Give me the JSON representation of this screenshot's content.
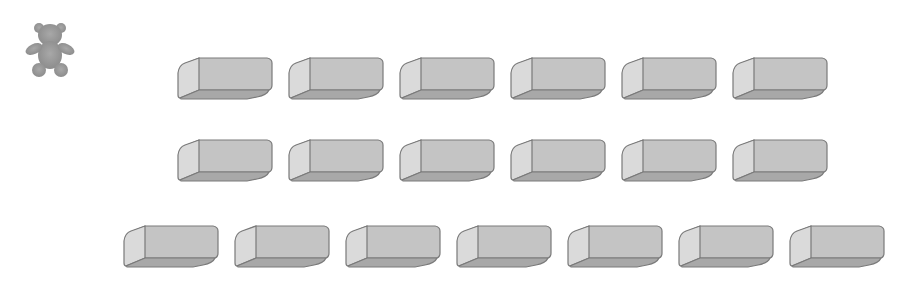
{
  "scene": {
    "description": "Counting picture: a teddy bear icon and rows of erasers",
    "bear": {
      "icon": "teddy-bear-icon",
      "color": "#9a9a9a"
    },
    "colors": {
      "eraser_top": "#c4c4c4",
      "eraser_front": "#dadada",
      "eraser_side": "#a8a8a8",
      "outline": "#7a7a7a"
    },
    "rows": [
      {
        "count": 6,
        "y": 57,
        "x_start": 177,
        "spacing": 111
      },
      {
        "count": 6,
        "y": 139,
        "x_start": 177,
        "spacing": 111
      },
      {
        "count": 7,
        "y": 225,
        "x_start": 123,
        "spacing": 111
      }
    ],
    "total_erasers": 19
  }
}
